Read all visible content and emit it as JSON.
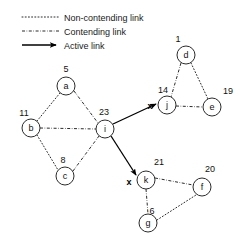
{
  "legend": {
    "items": [
      {
        "key": "non-contending",
        "label": "Non-contending link",
        "style": "dotted"
      },
      {
        "key": "contending",
        "label": "Contending link",
        "style": "dash-dot"
      },
      {
        "key": "active",
        "label": "Active link",
        "style": "solid-arrow"
      }
    ]
  },
  "diagram": {
    "type": "network-graph",
    "nodes": [
      {
        "id": "a",
        "label": "a",
        "value": "5",
        "x": 66,
        "y": 86,
        "value_x": 66,
        "value_y": 72
      },
      {
        "id": "b",
        "label": "b",
        "value": "11",
        "x": 31,
        "y": 128,
        "value_x": 24,
        "value_y": 116
      },
      {
        "id": "c",
        "label": "c",
        "value": "8",
        "x": 65,
        "y": 176,
        "value_x": 63,
        "value_y": 163
      },
      {
        "id": "i",
        "label": "i",
        "value": "23",
        "x": 105,
        "y": 129,
        "value_x": 104,
        "value_y": 115
      },
      {
        "id": "d",
        "label": "d",
        "value": "1",
        "x": 186,
        "y": 55,
        "value_x": 178,
        "value_y": 42
      },
      {
        "id": "j",
        "label": "j",
        "value": "14",
        "x": 167,
        "y": 105,
        "value_x": 163,
        "value_y": 93
      },
      {
        "id": "e",
        "label": "e",
        "value": "19",
        "x": 212,
        "y": 107,
        "value_x": 228,
        "value_y": 94
      },
      {
        "id": "k",
        "label": "k",
        "value": "21",
        "x": 146,
        "y": 180,
        "value_x": 159,
        "value_y": 165
      },
      {
        "id": "f",
        "label": "f",
        "value": "20",
        "x": 202,
        "y": 187,
        "value_x": 210,
        "value_y": 172
      },
      {
        "id": "g",
        "label": "g",
        "value": "6",
        "x": 148,
        "y": 223,
        "value_x": 152,
        "value_y": 214
      }
    ],
    "node_radius": 9,
    "edges": [
      {
        "from": "a",
        "to": "b",
        "type": "non-contending"
      },
      {
        "from": "b",
        "to": "c",
        "type": "non-contending"
      },
      {
        "from": "a",
        "to": "i",
        "type": "contending"
      },
      {
        "from": "b",
        "to": "i",
        "type": "contending"
      },
      {
        "from": "c",
        "to": "i",
        "type": "contending"
      },
      {
        "from": "d",
        "to": "j",
        "type": "contending"
      },
      {
        "from": "d",
        "to": "e",
        "type": "non-contending"
      },
      {
        "from": "j",
        "to": "e",
        "type": "contending"
      },
      {
        "from": "k",
        "to": "f",
        "type": "contending"
      },
      {
        "from": "k",
        "to": "g",
        "type": "contending"
      },
      {
        "from": "g",
        "to": "f",
        "type": "non-contending"
      },
      {
        "from": "i",
        "to": "j",
        "type": "active"
      },
      {
        "from": "i",
        "to": "k",
        "type": "active"
      }
    ],
    "markers": [
      {
        "label": "x",
        "x": 150,
        "y": 106,
        "near": "j"
      },
      {
        "label": "x",
        "x": 129,
        "y": 182,
        "near": "k"
      }
    ]
  },
  "colors": {
    "stroke": "#2b2b2b",
    "active": "#000000",
    "text": "#111111",
    "background": "#ffffff"
  }
}
